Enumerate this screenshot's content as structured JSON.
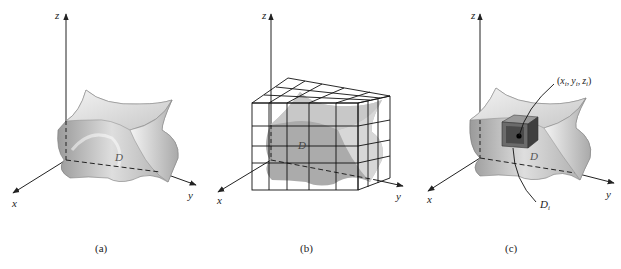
{
  "panels": [
    {
      "id": "a",
      "caption": "(a)",
      "axes": {
        "x": "x",
        "y": "y",
        "z": "z"
      },
      "region_label": "D"
    },
    {
      "id": "b",
      "caption": "(b)",
      "axes": {
        "x": "x",
        "y": "y",
        "z": "z"
      },
      "region_label": "D"
    },
    {
      "id": "c",
      "caption": "(c)",
      "axes": {
        "x": "x",
        "y": "y",
        "z": "z"
      },
      "region_label": "D",
      "subregion_label": "D",
      "subregion_sub": "i",
      "point_label": {
        "open": "(",
        "x": "x",
        "y": "y",
        "z": "z",
        "sub": "i",
        "close": ")"
      }
    }
  ],
  "colors": {
    "axis": "#222222",
    "surface_light": "#e6e6e6",
    "surface_mid": "#b9b9b9",
    "surface_dark": "#8f8f8f",
    "grid": "#111111",
    "box_dark": "#555555"
  }
}
